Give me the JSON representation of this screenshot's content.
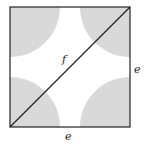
{
  "diagram": {
    "labels": {
      "diagonal": "f",
      "right_side": "e",
      "bottom_side": "e"
    },
    "colors": {
      "fill": "#d9d9d9",
      "stroke": "#222222",
      "background": "#ffffff"
    }
  }
}
